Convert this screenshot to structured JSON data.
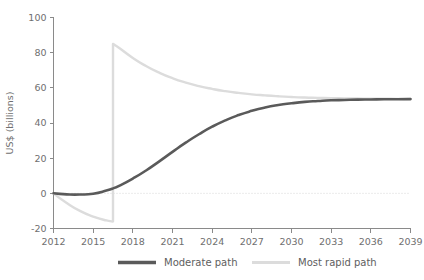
{
  "chart_data": {
    "type": "line",
    "title": "",
    "xlabel": "",
    "ylabel": "US$ (billions)",
    "xlim": [
      2012,
      2039
    ],
    "ylim": [
      -20,
      100
    ],
    "grid": false,
    "legend_position": "bottom",
    "x_ticks": [
      "2012",
      "2015",
      "2018",
      "2021",
      "2024",
      "2027",
      "2030",
      "2033",
      "2036",
      "2039"
    ],
    "y_ticks": [
      "-20",
      "0",
      "20",
      "40",
      "60",
      "80",
      "100"
    ],
    "zero_reference_line": 0,
    "series": [
      {
        "name": "Moderate path",
        "color": "#5a5a5a",
        "x": [
          2012,
          2013,
          2014,
          2015,
          2016,
          2016.6,
          2017,
          2018,
          2019,
          2020,
          2021,
          2022,
          2023,
          2024,
          2025,
          2026,
          2027,
          2028,
          2029,
          2030,
          2031,
          2032,
          2033,
          2034,
          2035,
          2036,
          2037,
          2038,
          2039
        ],
        "values": [
          0,
          -0.6,
          -0.7,
          -0.2,
          1.6,
          3.1,
          4.4,
          8.4,
          13.0,
          18.2,
          23.6,
          28.8,
          33.6,
          37.9,
          41.5,
          44.5,
          46.9,
          48.8,
          50.2,
          51.2,
          52.0,
          52.5,
          52.9,
          53.1,
          53.3,
          53.4,
          53.5,
          53.5,
          53.6
        ]
      },
      {
        "name": "Most rapid path",
        "color": "#dcdcdc",
        "x": [
          2012,
          2013,
          2014,
          2015,
          2016,
          2016.5,
          2016.5,
          2017,
          2018,
          2019,
          2020,
          2021,
          2022,
          2023,
          2024,
          2025,
          2026,
          2027,
          2028,
          2029,
          2030,
          2031,
          2032,
          2033,
          2034,
          2035,
          2036,
          2037,
          2038,
          2039
        ],
        "values": [
          0,
          -5.5,
          -10.0,
          -13.2,
          -15.4,
          -16.0,
          85.0,
          82.5,
          77.0,
          72.4,
          68.6,
          65.5,
          63.0,
          61.0,
          59.4,
          58.1,
          57.1,
          56.3,
          55.7,
          55.2,
          54.8,
          54.5,
          54.3,
          54.1,
          54.0,
          53.9,
          53.8,
          53.8,
          53.7,
          53.7
        ]
      }
    ]
  },
  "legend": {
    "items": [
      {
        "label": "Moderate path",
        "color": "#5a5a5a"
      },
      {
        "label": "Most rapid path",
        "color": "#dcdcdc"
      }
    ]
  }
}
